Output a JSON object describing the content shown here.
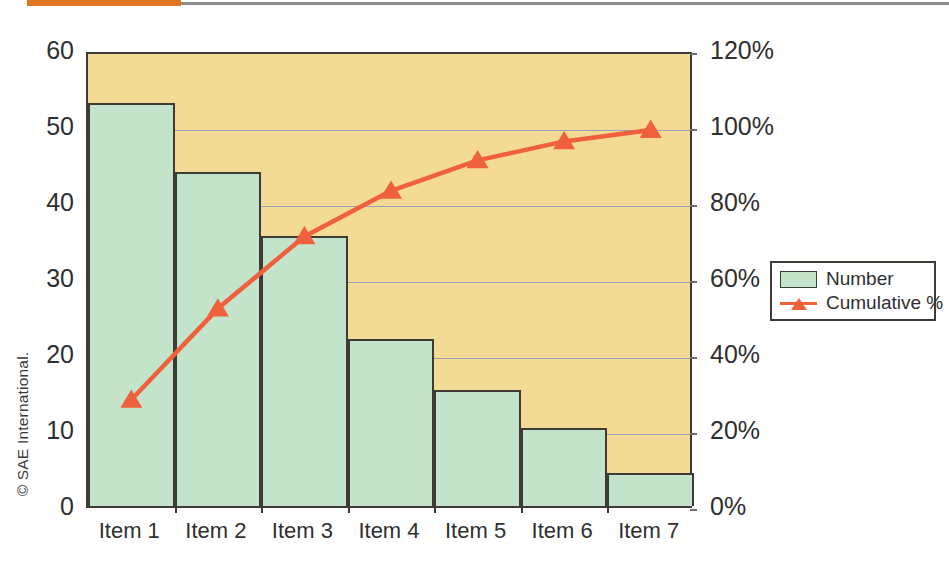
{
  "credit": "© SAE International.",
  "decor": {
    "rule_orange_color": "#e2761f",
    "rule_gray_color": "#8d8d8d"
  },
  "legend": {
    "position": "right",
    "entries": [
      {
        "label": "Number",
        "marker": "square-swatch-icon",
        "color": "#c3e3cb"
      },
      {
        "label": "Cumulative %",
        "marker": "triangle-line-icon",
        "color": "#f0603c"
      }
    ]
  },
  "chart_data": {
    "type": "bar",
    "title": "",
    "subtitle": "",
    "xlabel": "",
    "ylabel": "",
    "y2label": "",
    "grid": true,
    "categories": [
      "Item 1",
      "Item 2",
      "Item 3",
      "Item 4",
      "Item 5",
      "Item 6",
      "Item 7"
    ],
    "ylim": [
      0,
      60
    ],
    "yticks": [
      0,
      10,
      20,
      30,
      40,
      50,
      60
    ],
    "ytick_labels": [
      "0",
      "10",
      "20",
      "30",
      "40",
      "50",
      "60"
    ],
    "y2lim": [
      0,
      120
    ],
    "y2ticks": [
      0,
      20,
      40,
      60,
      80,
      100,
      120
    ],
    "y2tick_labels": [
      "0%",
      "20%",
      "40%",
      "60%",
      "80%",
      "100%",
      "120%"
    ],
    "series": [
      {
        "name": "Number",
        "type": "bar",
        "axis": "left",
        "color": "#c3e3cb",
        "edge_color": "#3f3a33",
        "values": [
          53,
          44,
          35.5,
          22,
          15.3,
          10.3,
          4.3
        ]
      },
      {
        "name": "Cumulative %",
        "type": "line",
        "axis": "right",
        "color": "#f0603c",
        "marker": "triangle",
        "values": [
          29,
          53,
          72,
          84,
          92,
          97,
          100
        ]
      }
    ],
    "plot_background": "#f4db95",
    "gridline_color": "#9aa0b4",
    "axis_color": "#3f3a33"
  }
}
